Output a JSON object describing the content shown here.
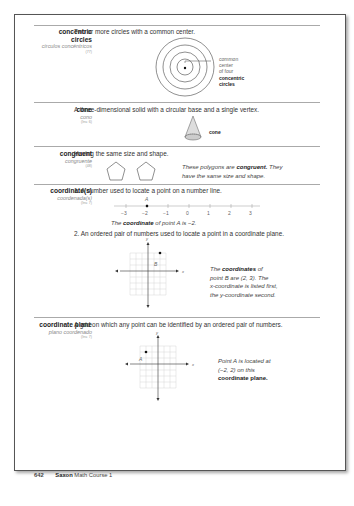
{
  "entries": [
    {
      "term": "concentric circles",
      "term_line1": "concentric",
      "term_line2": "circles",
      "spanish": "círculos concéntricos",
      "ref": "(77)",
      "definition": "Two or more circles with a common center.",
      "figure_label_lines": [
        "common",
        "center",
        "of four"
      ],
      "figure_label_bold": [
        "concentric",
        "circles"
      ]
    },
    {
      "term": "cone",
      "spanish": "cono",
      "ref": "(Inv. 6)",
      "definition": "A three-dimensional solid with a circular base and a single vertex.",
      "figure_label": "cone"
    },
    {
      "term": "congruent",
      "spanish": "congruente",
      "ref": "(48)",
      "definition": "Having the same size and shape.",
      "caption_pre": "These polygons are ",
      "caption_bold": "congruent.",
      "caption_post": " They",
      "caption_line2": "have the same size and shape."
    },
    {
      "term": "coordinate(s)",
      "spanish": "coordenada(s)",
      "ref": "(Inv. 7)",
      "item1": "1. A number used to locate a point on a number line.",
      "number_line_point": "A",
      "number_line_ticks": [
        "−3",
        "−2",
        "−1",
        "0",
        "1",
        "2",
        "3"
      ],
      "caption1_pre": "The ",
      "caption1_bold": "coordinate",
      "caption1_post": " of point A is −2.",
      "item2": "2. An ordered pair of numbers used to locate a point in a coordinate plane.",
      "point_label": "B",
      "axis_x": "x",
      "axis_y": "y",
      "caption2_pre": "The ",
      "caption2_bold": "coordinates",
      "caption2_post": " of",
      "caption2_lines": [
        "point B are (2, 3). The",
        "x-coordinate is listed first,",
        "the y-coordinate second."
      ]
    },
    {
      "term": "coordinate plane",
      "spanish": "plano coordenado",
      "ref": "(Inv. 7)",
      "definition": "A grid on which any point can be identified by an ordered pair of numbers.",
      "point_label": "A",
      "axis_x": "x",
      "axis_y": "y",
      "caption_lines": [
        "Point A is located at",
        "(−2, 2) on this"
      ],
      "caption_bold": "coordinate plane."
    }
  ],
  "footer": {
    "page_number": "642",
    "book_bold": "Saxon",
    "book_rest": " Math Course 1"
  }
}
